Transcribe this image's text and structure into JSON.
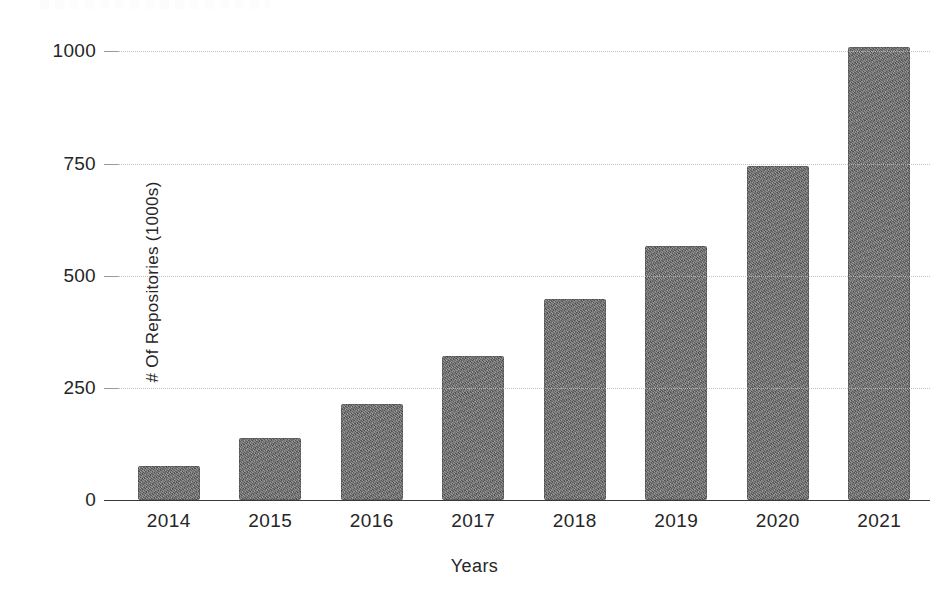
{
  "chart_data": {
    "type": "bar",
    "title": "",
    "xlabel": "Years",
    "ylabel": "# Of Repositories (1000s)",
    "categories": [
      "2014",
      "2015",
      "2016",
      "2017",
      "2018",
      "2019",
      "2020",
      "2021"
    ],
    "values": [
      75,
      139,
      214,
      320,
      448,
      567,
      745,
      1010
    ],
    "series": [
      {
        "name": "# Of Repositories (1000s)",
        "values": [
          75,
          139,
          214,
          320,
          448,
          567,
          745,
          1010
        ]
      }
    ],
    "ylim": [
      0,
      1010
    ],
    "yticks": [
      0,
      250,
      500,
      750,
      1000
    ],
    "ytick_labels": [
      "0",
      "250",
      "500",
      "750",
      "1000"
    ],
    "xtick_labels": [
      "2014",
      "2015",
      "2016",
      "2017",
      "2018",
      "2019",
      "2020",
      "2021"
    ],
    "grid": true,
    "grid_axis": "y",
    "legend": false,
    "legend_position": "none",
    "bar_color": "#6e6e6e",
    "gridline_color": "#b9b9b9",
    "axis_color": "#3a3a3a",
    "text_color": "#262626",
    "background_color": "#ffffff"
  },
  "axes": {
    "y_title": "# Of Repositories (1000s)",
    "x_title": "Years"
  }
}
